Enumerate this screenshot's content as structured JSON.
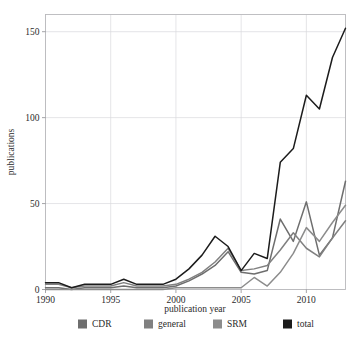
{
  "chart_data": {
    "type": "line",
    "title": "",
    "xlabel": "publication year",
    "ylabel": "publications",
    "xlim": [
      1990,
      2013
    ],
    "ylim": [
      0,
      160
    ],
    "grid": true,
    "legend_position": "bottom",
    "xticks": [
      1990,
      1995,
      2000,
      2005,
      2010
    ],
    "xtick_labels": [
      "1990",
      "1995",
      "2000",
      "2005",
      "2010"
    ],
    "yticks": [
      0,
      50,
      100,
      150
    ],
    "ytick_labels": [
      "0",
      "50",
      "100",
      "150"
    ],
    "x": [
      1990,
      1991,
      1992,
      1993,
      1994,
      1995,
      1996,
      1997,
      1998,
      1999,
      2000,
      2001,
      2002,
      2003,
      2004,
      2005,
      2006,
      2007,
      2008,
      2009,
      2010,
      2011,
      2012,
      2013
    ],
    "series": [
      {
        "name": "CDR",
        "color": "#6e6e6e",
        "values": [
          1,
          1,
          0,
          1,
          1,
          1,
          2,
          1,
          1,
          1,
          2,
          5,
          9,
          14,
          22,
          10,
          9,
          11,
          41,
          28,
          51,
          20,
          30,
          63
        ]
      },
      {
        "name": "general",
        "color": "#808080",
        "values": [
          3,
          3,
          1,
          2,
          2,
          2,
          4,
          2,
          2,
          2,
          3,
          6,
          10,
          16,
          24,
          11,
          12,
          14,
          23,
          33,
          24,
          19,
          30,
          40
        ]
      },
      {
        "name": "SRM",
        "color": "#8c8c8c",
        "values": [
          0,
          0,
          0,
          0,
          0,
          0,
          0,
          0,
          0,
          0,
          1,
          1,
          1,
          1,
          1,
          1,
          7,
          2,
          10,
          21,
          36,
          28,
          39,
          49
        ]
      },
      {
        "name": "total",
        "color": "#1c1c1c",
        "values": [
          4,
          4,
          1,
          3,
          3,
          3,
          6,
          3,
          3,
          3,
          6,
          12,
          20,
          31,
          25,
          11,
          21,
          18,
          74,
          82,
          113,
          105,
          135,
          152
        ]
      }
    ]
  },
  "legend": {
    "items": [
      {
        "label": "CDR",
        "color": "#6e6e6e"
      },
      {
        "label": "general",
        "color": "#808080"
      },
      {
        "label": "SRM",
        "color": "#8c8c8c"
      },
      {
        "label": "total",
        "color": "#1c1c1c"
      }
    ]
  }
}
